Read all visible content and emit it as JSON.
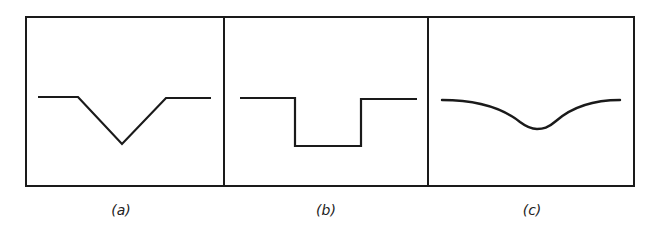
{
  "figure": {
    "type": "three-panel profile diagram",
    "stroke_color": "#1a1a1a",
    "background": "#ffffff",
    "panels": [
      {
        "id": "a",
        "label": "(a)",
        "shape": "v-notch",
        "description": "Flat line with a V-shaped (triangular) depression in the middle"
      },
      {
        "id": "b",
        "label": "(b)",
        "shape": "rectangular-notch",
        "description": "Flat line with a rectangular (square-well) depression in the middle"
      },
      {
        "id": "c",
        "label": "(c)",
        "shape": "smooth-dip",
        "description": "Flat line with a smooth, rounded (Gaussian-like) depression in the middle"
      }
    ]
  }
}
